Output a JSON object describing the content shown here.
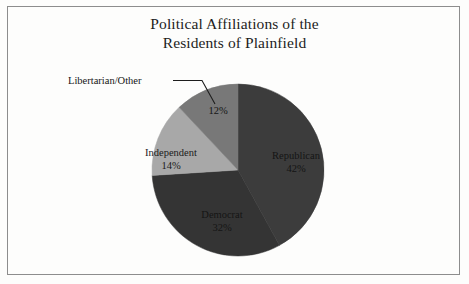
{
  "figure": {
    "width": 469,
    "height": 284,
    "background_color": "#fdfdfc",
    "frame_color": "#8d8d8d"
  },
  "title": {
    "line1": "Political Affiliations of the",
    "line2": "Residents of Plainfield"
  },
  "leader": {
    "label": "Libertarian/Other"
  },
  "chart_data": {
    "type": "pie",
    "title": "Political Affiliations of the Residents of Plainfield",
    "xlabel": "",
    "ylabel": "",
    "legend": "none",
    "grid": false,
    "value_suffix": "%",
    "start_angle_deg": 0,
    "direction": "clockwise",
    "center": [
      238,
      170
    ],
    "radius": 86,
    "categories": [
      "Republican",
      "Democrat",
      "Independent",
      "Libertarian/Other"
    ],
    "values": [
      42,
      32,
      14,
      12
    ],
    "colors": [
      "#3c3c3c",
      "#343434",
      "#a8a8a8",
      "#787878"
    ],
    "slices": [
      {
        "label": "Republican",
        "value": 42,
        "value_text": "42%",
        "color": "#3c3c3c",
        "label_position": "inside",
        "label_text_color": "#141414"
      },
      {
        "label": "Democrat",
        "value": 32,
        "value_text": "32%",
        "color": "#343434",
        "label_position": "inside",
        "label_text_color": "#141414"
      },
      {
        "label": "Independent",
        "value": 14,
        "value_text": "14%",
        "color": "#a8a8a8",
        "label_position": "inside",
        "label_text_color": "#1b1b1b"
      },
      {
        "label": "Libertarian/Other",
        "value": 12,
        "value_text": "12%",
        "color": "#787878",
        "label_position": "outside-left-with-leader",
        "label_text_color": "#151515"
      }
    ]
  }
}
